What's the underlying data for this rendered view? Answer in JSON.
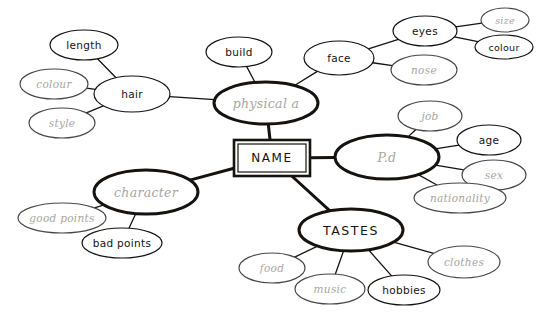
{
  "diagram": {
    "type": "mind-map",
    "title": "NAME",
    "background": "#ffffff",
    "ink_dark": "#15120f",
    "ink_mid": "#6e6a66",
    "ink_light": "#a9a5a1",
    "center": {
      "label": "NAME",
      "shape": "double-rectangle",
      "x": 272,
      "y": 158,
      "w": 76,
      "h": 36
    },
    "nodes": [
      {
        "id": "physical_a",
        "label": "physical a",
        "x": 266,
        "y": 103,
        "rx": 52,
        "ry": 21,
        "weight": "heavy",
        "ink": "light",
        "style": "cursive",
        "level": 1
      },
      {
        "id": "pd",
        "label": "P.d",
        "x": 387,
        "y": 157,
        "rx": 52,
        "ry": 22,
        "weight": "heavy",
        "ink": "light",
        "style": "cursive",
        "level": 1
      },
      {
        "id": "tastes",
        "label": "TASTES",
        "x": 351,
        "y": 230,
        "rx": 52,
        "ry": 21,
        "weight": "heavy",
        "ink": "dark",
        "style": "caps",
        "level": 1
      },
      {
        "id": "character",
        "label": "character",
        "x": 146,
        "y": 192,
        "rx": 52,
        "ry": 22,
        "weight": "heavy",
        "ink": "light",
        "style": "cursive",
        "level": 1
      },
      {
        "id": "hair",
        "label": "hair",
        "x": 132,
        "y": 94,
        "rx": 38,
        "ry": 18,
        "weight": "normal",
        "ink": "dark",
        "style": "plain",
        "level": 2
      },
      {
        "id": "build",
        "label": "build",
        "x": 239,
        "y": 52,
        "rx": 33,
        "ry": 15,
        "weight": "normal",
        "ink": "dark",
        "style": "plain",
        "level": 2
      },
      {
        "id": "face",
        "label": "face",
        "x": 339,
        "y": 58,
        "rx": 35,
        "ry": 17,
        "weight": "normal",
        "ink": "dark",
        "style": "plain",
        "level": 2
      },
      {
        "id": "length",
        "label": "length",
        "x": 84,
        "y": 45,
        "rx": 34,
        "ry": 15,
        "weight": "normal",
        "ink": "dark",
        "style": "plain",
        "level": 3
      },
      {
        "id": "hair_colour",
        "label": "colour",
        "x": 54,
        "y": 84,
        "rx": 34,
        "ry": 15,
        "weight": "normal",
        "ink": "light",
        "style": "cursive",
        "level": 3
      },
      {
        "id": "style",
        "label": "style",
        "x": 62,
        "y": 123,
        "rx": 33,
        "ry": 15,
        "weight": "normal",
        "ink": "light",
        "style": "cursive",
        "level": 3
      },
      {
        "id": "eyes",
        "label": "eyes",
        "x": 425,
        "y": 31,
        "rx": 32,
        "ry": 15,
        "weight": "normal",
        "ink": "dark",
        "style": "plain",
        "level": 3
      },
      {
        "id": "nose",
        "label": "nose",
        "x": 424,
        "y": 70,
        "rx": 33,
        "ry": 15,
        "weight": "normal",
        "ink": "light",
        "style": "cursive",
        "level": 3
      },
      {
        "id": "eye_size",
        "label": "size",
        "x": 505,
        "y": 20,
        "rx": 24,
        "ry": 12,
        "weight": "normal",
        "ink": "light",
        "style": "cursive",
        "level": 4
      },
      {
        "id": "eye_colour",
        "label": "colour",
        "x": 504,
        "y": 47,
        "rx": 29,
        "ry": 12,
        "weight": "normal",
        "ink": "dark",
        "style": "plain",
        "level": 4
      },
      {
        "id": "job",
        "label": "job",
        "x": 430,
        "y": 116,
        "rx": 32,
        "ry": 15,
        "weight": "normal",
        "ink": "light",
        "style": "cursive",
        "level": 2
      },
      {
        "id": "age",
        "label": "age",
        "x": 489,
        "y": 140,
        "rx": 32,
        "ry": 15,
        "weight": "normal",
        "ink": "dark",
        "style": "plain",
        "level": 2
      },
      {
        "id": "sex",
        "label": "sex",
        "x": 494,
        "y": 175,
        "rx": 32,
        "ry": 15,
        "weight": "normal",
        "ink": "light",
        "style": "cursive",
        "level": 2
      },
      {
        "id": "nationality",
        "label": "nationality",
        "x": 460,
        "y": 198,
        "rx": 46,
        "ry": 15,
        "weight": "normal",
        "ink": "light",
        "style": "cursive",
        "level": 2
      },
      {
        "id": "good_points",
        "label": "good points",
        "x": 62,
        "y": 218,
        "rx": 44,
        "ry": 15,
        "weight": "normal",
        "ink": "light",
        "style": "cursive",
        "level": 2
      },
      {
        "id": "bad_points",
        "label": "bad points",
        "x": 122,
        "y": 243,
        "rx": 40,
        "ry": 15,
        "weight": "normal",
        "ink": "dark",
        "style": "plain",
        "level": 2
      },
      {
        "id": "food",
        "label": "food",
        "x": 272,
        "y": 268,
        "rx": 33,
        "ry": 15,
        "weight": "normal",
        "ink": "light",
        "style": "cursive",
        "level": 2
      },
      {
        "id": "music",
        "label": "music",
        "x": 330,
        "y": 289,
        "rx": 35,
        "ry": 15,
        "weight": "normal",
        "ink": "light",
        "style": "cursive",
        "level": 2
      },
      {
        "id": "hobbies",
        "label": "hobbies",
        "x": 404,
        "y": 290,
        "rx": 36,
        "ry": 15,
        "weight": "normal",
        "ink": "dark",
        "style": "plain",
        "level": 2
      },
      {
        "id": "clothes",
        "label": "clothes",
        "x": 464,
        "y": 262,
        "rx": 36,
        "ry": 16,
        "weight": "normal",
        "ink": "light",
        "style": "cursive",
        "level": 2
      }
    ],
    "edges": [
      {
        "from": "center",
        "to": "physical_a",
        "weight": "heavy"
      },
      {
        "from": "center",
        "to": "pd",
        "weight": "heavy"
      },
      {
        "from": "center",
        "to": "tastes",
        "weight": "heavy"
      },
      {
        "from": "center",
        "to": "character",
        "weight": "heavy"
      },
      {
        "from": "physical_a",
        "to": "hair",
        "weight": "normal"
      },
      {
        "from": "physical_a",
        "to": "build",
        "weight": "normal"
      },
      {
        "from": "physical_a",
        "to": "face",
        "weight": "normal"
      },
      {
        "from": "hair",
        "to": "length",
        "weight": "normal"
      },
      {
        "from": "hair",
        "to": "hair_colour",
        "weight": "normal"
      },
      {
        "from": "hair",
        "to": "style",
        "weight": "normal"
      },
      {
        "from": "face",
        "to": "eyes",
        "weight": "normal"
      },
      {
        "from": "face",
        "to": "nose",
        "weight": "normal"
      },
      {
        "from": "eyes",
        "to": "eye_size",
        "weight": "normal"
      },
      {
        "from": "eyes",
        "to": "eye_colour",
        "weight": "normal"
      },
      {
        "from": "pd",
        "to": "job",
        "weight": "normal"
      },
      {
        "from": "pd",
        "to": "age",
        "weight": "normal"
      },
      {
        "from": "pd",
        "to": "sex",
        "weight": "normal"
      },
      {
        "from": "pd",
        "to": "nationality",
        "weight": "normal"
      },
      {
        "from": "character",
        "to": "good_points",
        "weight": "normal"
      },
      {
        "from": "character",
        "to": "bad_points",
        "weight": "normal"
      },
      {
        "from": "tastes",
        "to": "food",
        "weight": "normal"
      },
      {
        "from": "tastes",
        "to": "music",
        "weight": "normal"
      },
      {
        "from": "tastes",
        "to": "hobbies",
        "weight": "normal"
      },
      {
        "from": "tastes",
        "to": "clothes",
        "weight": "normal"
      }
    ]
  }
}
